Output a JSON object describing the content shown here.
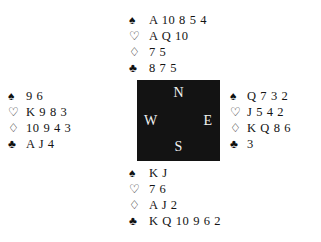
{
  "diagram": {
    "type": "bridge-hand-diagram",
    "suit_symbols": {
      "spade": "♠",
      "heart": "♡",
      "diamond": "♢",
      "club": "♣"
    },
    "compass": {
      "north": "N",
      "west": "W",
      "east": "E",
      "south": "S",
      "background_color": "#131313",
      "text_color": "#f2f2f2"
    },
    "hands": {
      "north": {
        "spades": "A 10 8 5 4",
        "hearts": "A Q 10",
        "diamonds": "7 5",
        "clubs": "8 7 5"
      },
      "west": {
        "spades": "9 6",
        "hearts": "K 9 8 3",
        "diamonds": "10 9 4 3",
        "clubs": "A J 4"
      },
      "east": {
        "spades": "Q 7 3 2",
        "hearts": "J 5 4 2",
        "diamonds": "K Q 8 6",
        "clubs": "3"
      },
      "south": {
        "spades": "K J",
        "hearts": "7 6",
        "diamonds": "A J 2",
        "clubs": "K Q 10 9 6 2"
      }
    }
  }
}
